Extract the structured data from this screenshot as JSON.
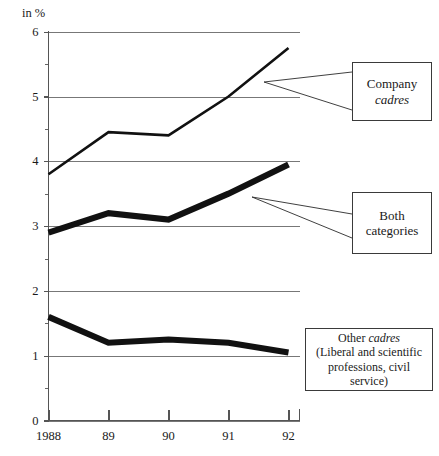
{
  "chart_data": {
    "type": "line",
    "title": "",
    "subtitle": "",
    "xlabel": "",
    "ylabel": "in %",
    "unit_label": "in %",
    "x": [
      1988,
      1989,
      1990,
      1991,
      1992
    ],
    "categories": [
      "1988",
      "89",
      "90",
      "91",
      "92"
    ],
    "xtick_labels": [
      "1988",
      "89",
      "90",
      "91",
      "92"
    ],
    "ytick_labels": [
      "0",
      "1",
      "2",
      "3",
      "4",
      "5",
      "6"
    ],
    "ytick_values": [
      0,
      1,
      2,
      3,
      4,
      5,
      6
    ],
    "yminor_values": [
      0.5,
      1.5,
      2.5,
      3.5,
      4.5,
      5.5
    ],
    "ylim": [
      0,
      6
    ],
    "grid": true,
    "grid_axis": "y",
    "legend": "callout-boxes",
    "legend_position": "right",
    "series": [
      {
        "name": "Company cadres",
        "style": "thin",
        "values": [
          3.8,
          4.45,
          4.4,
          5.0,
          5.75
        ]
      },
      {
        "name": "Both categories",
        "style": "thick",
        "values": [
          2.9,
          3.2,
          3.1,
          3.5,
          3.95
        ]
      },
      {
        "name": "Other cadres",
        "style": "thick",
        "values": [
          1.6,
          1.2,
          1.25,
          1.2,
          1.05
        ]
      }
    ],
    "annotations": [
      {
        "id": "company",
        "line1": "Company",
        "line2": "cadres",
        "line2_italic": true
      },
      {
        "id": "both",
        "line1": "Both",
        "line2": "categories",
        "line2_italic": false
      },
      {
        "id": "other",
        "line1_prefix": "Other ",
        "line1_italic": "cadres",
        "line2": "(Liberal and scientific",
        "line3": "professions, civil",
        "line4": "service)"
      }
    ]
  },
  "axis": {
    "unit": "in %",
    "y_labels": [
      "6",
      "5",
      "4",
      "3",
      "2",
      "1",
      "0"
    ],
    "x_labels": [
      "1988",
      "89",
      "90",
      "91",
      "92"
    ]
  },
  "colors": {
    "series": "#111111",
    "grid": "#777777",
    "axis": "#555555",
    "box_border": "#3a3a3a",
    "background": "#ffffff"
  }
}
